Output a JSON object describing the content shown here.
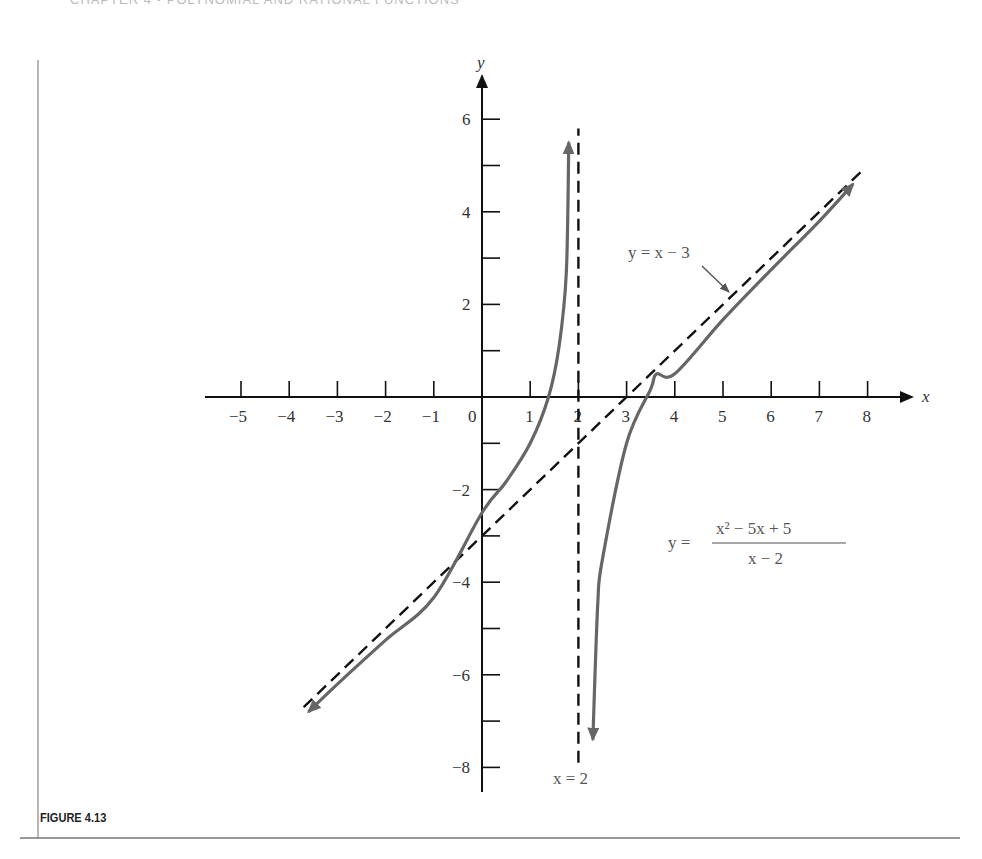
{
  "page": {
    "header_text": "CHAPTER 4 • POLYNOMIAL AND RATIONAL FUNCTIONS",
    "figure_caption": "FIGURE 4.13"
  },
  "chart_data": {
    "type": "line",
    "title": "",
    "xlabel": "x",
    "ylabel": "y",
    "xlim": [
      -5,
      8
    ],
    "ylim": [
      -8,
      6
    ],
    "x_ticks": [
      -5,
      -4,
      -3,
      -2,
      -1,
      0,
      1,
      2,
      3,
      4,
      5,
      6,
      7,
      8
    ],
    "x_tick_labels": [
      "−5",
      "−4",
      "−3",
      "−2",
      "−1",
      "0",
      "1",
      "2",
      "3",
      "4",
      "5",
      "6",
      "7",
      "8"
    ],
    "y_ticks": [
      -8,
      -7,
      -6,
      -5,
      -4,
      -3,
      -2,
      -1,
      1,
      2,
      3,
      4,
      5,
      6
    ],
    "y_tick_labels": {
      "6": "6",
      "4": "4",
      "2": "2",
      "-2": "−2",
      "-4": "−4",
      "-6": "−6",
      "-8": "−8"
    },
    "grid": false,
    "series": [
      {
        "name": "y = (x² − 5x + 5)/(x − 2), left branch",
        "style": "solid",
        "color": "#666666",
        "x": [
          -3.6,
          -3,
          -2,
          -1,
          0,
          0.5,
          1,
          1.38,
          1.6,
          1.75,
          1.8
        ],
        "y": [
          -6.8,
          -6.2,
          -5.25,
          -4.33,
          -2.5,
          -1.83,
          -1.0,
          0.0,
          1.1,
          2.7,
          5.5
        ]
      },
      {
        "name": "y = (x² − 5x + 5)/(x − 2), right branch",
        "style": "solid",
        "color": "#666666",
        "x": [
          2.3,
          2.4,
          2.5,
          3,
          3.5,
          3.62,
          4,
          5,
          6,
          7,
          7.7
        ],
        "y": [
          -7.4,
          -4.5,
          -3.5,
          -1.0,
          0.17,
          0.5,
          0.5,
          1.67,
          2.75,
          3.8,
          4.6
        ]
      },
      {
        "name": "y = x − 3 (slant asymptote)",
        "style": "dashed",
        "color": "#111111",
        "x": [
          -3.7,
          7.9
        ],
        "y": [
          -6.7,
          4.9
        ]
      },
      {
        "name": "x = 2 (vertical asymptote)",
        "style": "dashed",
        "color": "#111111",
        "x": [
          2,
          2
        ],
        "y": [
          -7.9,
          5.8
        ]
      }
    ],
    "annotations": [
      {
        "text": "y = x − 3",
        "x": 5.3,
        "y": 3.3,
        "arrow_to": [
          5.1,
          2.2
        ]
      },
      {
        "text": "x = 2",
        "x": 2.2,
        "y": -8.2
      },
      {
        "text_numerator": "x² − 5x + 5",
        "text_denominator": "x − 2",
        "text_prefix": "y =",
        "x": 4.9,
        "y": -3.1
      }
    ],
    "labels": {
      "x_axis": "x",
      "y_axis": "y",
      "slant": "y = x − 3",
      "vertical": "x = 2",
      "func_prefix": "y =",
      "func_num": "x² − 5x + 5",
      "func_den": "x − 2"
    }
  }
}
